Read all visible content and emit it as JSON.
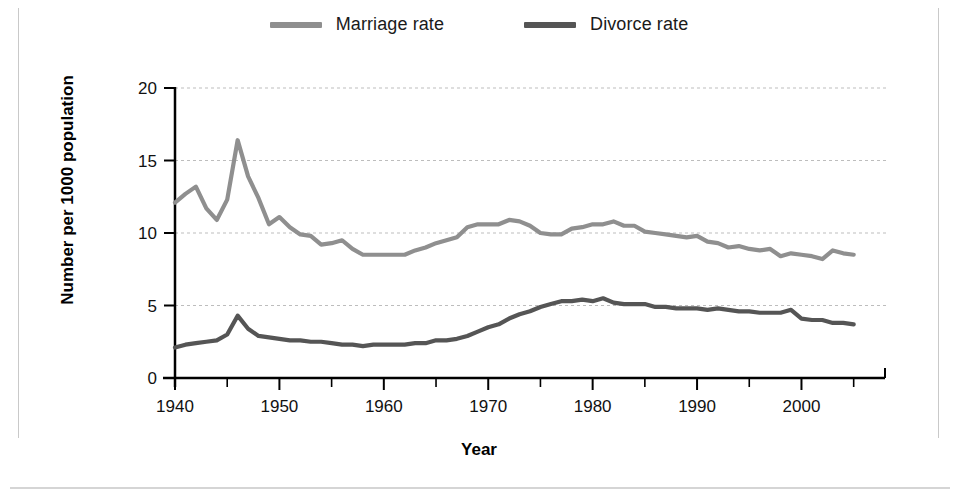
{
  "figure": {
    "background": "#ffffff",
    "frame_color": "#c9c9c9"
  },
  "legend": {
    "position": "top-center",
    "entries": [
      {
        "label": "Marriage rate",
        "color": "#8f8f8f",
        "swatch_name": "marriage-rate-swatch"
      },
      {
        "label": "Divorce rate",
        "color": "#555555",
        "swatch_name": "divorce-rate-swatch"
      }
    ]
  },
  "axes": {
    "x_title": "Year",
    "y_title": "Number per 1000 population",
    "x_ticks_major": [
      "1940",
      "1950",
      "1960",
      "1970",
      "1980",
      "1990",
      "2000"
    ],
    "x_ticks_major_values": [
      1940,
      1950,
      1960,
      1970,
      1980,
      1990,
      2000
    ],
    "x_ticks_minor_values": [
      1945,
      1955,
      1965,
      1975,
      1985,
      1995,
      2005
    ],
    "y_ticks": [
      "0",
      "5",
      "10",
      "15",
      "20"
    ],
    "y_tick_values": [
      0,
      5,
      10,
      15,
      20
    ],
    "xlim": [
      1940,
      2008
    ],
    "ylim": [
      0,
      20
    ],
    "grid": "horizontal-dashed"
  },
  "chart_data": {
    "type": "line",
    "title": "",
    "subtitle": "",
    "xlabel": "Year",
    "ylabel": "Number per 1000 population",
    "xlim": [
      1940,
      2008
    ],
    "ylim": [
      0,
      20
    ],
    "grid": true,
    "legend_position": "top-center",
    "x": [
      1940,
      1941,
      1942,
      1943,
      1944,
      1945,
      1946,
      1947,
      1948,
      1949,
      1950,
      1951,
      1952,
      1953,
      1954,
      1955,
      1956,
      1957,
      1958,
      1959,
      1960,
      1961,
      1962,
      1963,
      1964,
      1965,
      1966,
      1967,
      1968,
      1969,
      1970,
      1971,
      1972,
      1973,
      1974,
      1975,
      1976,
      1977,
      1978,
      1979,
      1980,
      1981,
      1982,
      1983,
      1984,
      1985,
      1986,
      1987,
      1988,
      1989,
      1990,
      1991,
      1992,
      1993,
      1994,
      1995,
      1996,
      1997,
      1998,
      1999,
      2000,
      2001,
      2002,
      2003,
      2004,
      2005
    ],
    "series": [
      {
        "name": "Marriage rate",
        "color": "#8f8f8f",
        "values": [
          12.1,
          12.7,
          13.2,
          11.7,
          10.9,
          12.3,
          16.4,
          13.9,
          12.4,
          10.6,
          11.1,
          10.4,
          9.9,
          9.8,
          9.2,
          9.3,
          9.5,
          8.9,
          8.5,
          8.5,
          8.5,
          8.5,
          8.5,
          8.8,
          9.0,
          9.3,
          9.5,
          9.7,
          10.4,
          10.6,
          10.6,
          10.6,
          10.9,
          10.8,
          10.5,
          10.0,
          9.9,
          9.9,
          10.3,
          10.4,
          10.6,
          10.6,
          10.8,
          10.5,
          10.5,
          10.1,
          10.0,
          9.9,
          9.8,
          9.7,
          9.8,
          9.4,
          9.3,
          9.0,
          9.1,
          8.9,
          8.8,
          8.9,
          8.4,
          8.6,
          8.5,
          8.4,
          8.2,
          8.8,
          8.6,
          8.5
        ]
      },
      {
        "name": "Divorce rate",
        "color": "#555555",
        "values": [
          2.1,
          2.3,
          2.4,
          2.5,
          2.6,
          3.0,
          4.3,
          3.4,
          2.9,
          2.8,
          2.7,
          2.6,
          2.6,
          2.5,
          2.5,
          2.4,
          2.3,
          2.3,
          2.2,
          2.3,
          2.3,
          2.3,
          2.3,
          2.4,
          2.4,
          2.6,
          2.6,
          2.7,
          2.9,
          3.2,
          3.5,
          3.7,
          4.1,
          4.4,
          4.6,
          4.9,
          5.1,
          5.3,
          5.3,
          5.4,
          5.3,
          5.5,
          5.2,
          5.1,
          5.1,
          5.1,
          4.9,
          4.9,
          4.8,
          4.8,
          4.8,
          4.7,
          4.8,
          4.7,
          4.6,
          4.6,
          4.5,
          4.5,
          4.5,
          4.7,
          4.1,
          4.0,
          4.0,
          3.8,
          3.8,
          3.7
        ]
      }
    ]
  }
}
